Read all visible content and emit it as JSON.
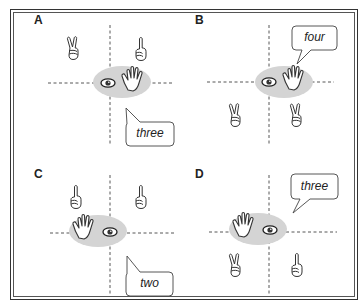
{
  "figure": {
    "panels": [
      {
        "id": "A",
        "label": "A",
        "speech": "three",
        "observer_hand": "right-of-eye",
        "hands": [
          {
            "pos": "top-left",
            "gesture": "two-fingers"
          },
          {
            "pos": "top-right",
            "gesture": "one-finger"
          }
        ],
        "bubble_pos": "bottom-right"
      },
      {
        "id": "B",
        "label": "B",
        "speech": "four",
        "observer_hand": "right-of-eye",
        "hands": [
          {
            "pos": "bottom-left",
            "gesture": "two-fingers"
          },
          {
            "pos": "bottom-right",
            "gesture": "two-fingers"
          }
        ],
        "bubble_pos": "top-right"
      },
      {
        "id": "C",
        "label": "C",
        "speech": "two",
        "observer_hand": "left-of-eye",
        "hands": [
          {
            "pos": "top-left",
            "gesture": "one-finger"
          },
          {
            "pos": "top-right",
            "gesture": "one-finger"
          }
        ],
        "bubble_pos": "bottom-right"
      },
      {
        "id": "D",
        "label": "D",
        "speech": "three",
        "observer_hand": "left-of-eye",
        "hands": [
          {
            "pos": "bottom-left",
            "gesture": "two-fingers"
          },
          {
            "pos": "bottom-right",
            "gesture": "one-finger"
          }
        ],
        "bubble_pos": "top-right"
      }
    ],
    "icons": {
      "eye": "eye-icon",
      "open_hand": "open-hand-icon",
      "two_fingers": "victory-hand-icon",
      "one_finger": "index-finger-icon"
    },
    "colors": {
      "ellipse": "#d4d4d4",
      "line": "#444444",
      "frame": "#333333",
      "bubble_border": "#444444"
    }
  }
}
